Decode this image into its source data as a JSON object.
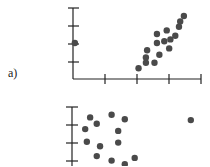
{
  "labels": {
    "a": "a)"
  },
  "chart_data": [
    {
      "type": "scatter",
      "panel_label": "a)",
      "title": "",
      "xlabel": "",
      "ylabel": "",
      "grid": false,
      "points": [
        [
          0.3,
          2.0
        ],
        [
          2.9,
          0.6
        ],
        [
          3.2,
          0.9
        ],
        [
          3.2,
          1.2
        ],
        [
          3.25,
          1.6
        ],
        [
          3.55,
          0.9
        ],
        [
          3.75,
          1.35
        ],
        [
          3.65,
          2.0
        ],
        [
          3.65,
          2.5
        ],
        [
          3.95,
          2.1
        ],
        [
          4.05,
          2.7
        ],
        [
          4.15,
          1.7
        ],
        [
          4.2,
          2.2
        ],
        [
          4.4,
          2.4
        ],
        [
          4.55,
          2.9
        ],
        [
          4.6,
          3.2
        ],
        [
          4.75,
          3.5
        ]
      ],
      "xlim": [
        0,
        4
      ],
      "ylim": [
        0,
        4
      ]
    },
    {
      "type": "scatter",
      "panel_label": "",
      "title": "",
      "xlabel": "",
      "ylabel": "",
      "grid": false,
      "points": [
        [
          0.55,
          2.7
        ],
        [
          1.2,
          2.85
        ],
        [
          1.6,
          2.6
        ],
        [
          0.75,
          2.35
        ],
        [
          0.4,
          2.05
        ],
        [
          1.4,
          1.95
        ],
        [
          0.45,
          1.35
        ],
        [
          0.85,
          1.1
        ],
        [
          1.4,
          1.3
        ],
        [
          0.75,
          0.55
        ],
        [
          1.2,
          0.3
        ],
        [
          1.9,
          0.45
        ],
        [
          1.6,
          0.1
        ],
        [
          3.6,
          2.55
        ]
      ],
      "xlim": [
        0,
        4
      ],
      "ylim": [
        0,
        3
      ]
    }
  ]
}
